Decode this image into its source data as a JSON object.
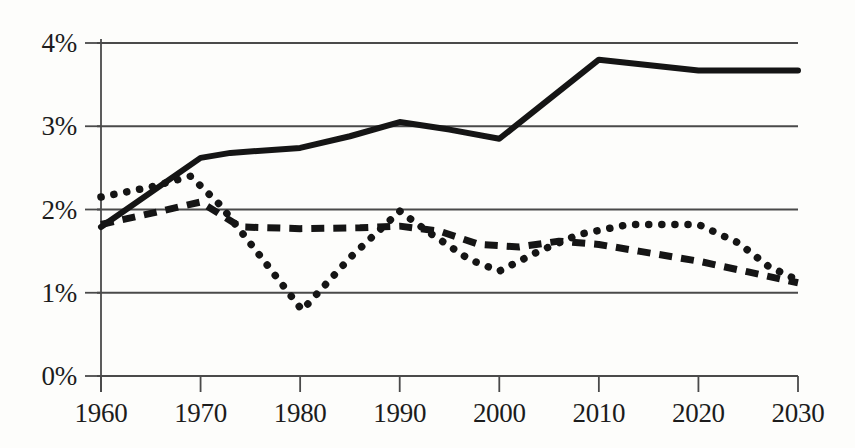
{
  "chart_data": {
    "type": "line",
    "title": "",
    "xlabel": "",
    "ylabel": "",
    "xlim": [
      1960,
      2030
    ],
    "ylim": [
      0,
      4
    ],
    "grid": "horizontal",
    "legend": "none",
    "y_tick_labels": [
      "0%",
      "1%",
      "2%",
      "3%",
      "4%"
    ],
    "y_tick_values": [
      0,
      1,
      2,
      3,
      4
    ],
    "x_tick_labels": [
      "1960",
      "1970",
      "1980",
      "1990",
      "2000",
      "2010",
      "2020",
      "2030"
    ],
    "x_tick_values": [
      1960,
      1970,
      1980,
      1990,
      2000,
      2010,
      2020,
      2030
    ],
    "series": [
      {
        "name": "solid-series",
        "style": "solid",
        "color": "#151515",
        "width": 6,
        "x": [
          1960,
          1970,
          1973,
          1980,
          1985,
          1990,
          1995,
          2000,
          2010,
          2020,
          2030
        ],
        "values": [
          1.79,
          2.62,
          2.68,
          2.74,
          2.88,
          3.05,
          2.96,
          2.85,
          3.8,
          3.67,
          3.67
        ]
      },
      {
        "name": "dotted-series",
        "style": "dotted",
        "color": "#151515",
        "width": 7,
        "x": [
          1960,
          1965,
          1969,
          1972,
          1976,
          1980.2,
          1985,
          1990,
          1993,
          1997,
          2000,
          2004,
          2008,
          2013,
          2020,
          2024,
          2027,
          2030
        ],
        "values": [
          2.15,
          2.27,
          2.4,
          2.05,
          1.44,
          0.79,
          1.42,
          1.98,
          1.72,
          1.4,
          1.26,
          1.5,
          1.7,
          1.82,
          1.82,
          1.6,
          1.32,
          1.15
        ]
      },
      {
        "name": "dashed-series",
        "style": "dashed",
        "color": "#151515",
        "width": 7,
        "x": [
          1960,
          1966,
          1970,
          1974,
          1980,
          1986,
          1990,
          1994,
          1998,
          2002,
          2006,
          2010,
          2014,
          2020,
          2025,
          2030
        ],
        "values": [
          1.82,
          1.98,
          2.09,
          1.79,
          1.77,
          1.78,
          1.8,
          1.74,
          1.58,
          1.55,
          1.62,
          1.58,
          1.5,
          1.38,
          1.25,
          1.12
        ]
      }
    ]
  },
  "axes": {
    "axis_color": "#4a4a4a",
    "tick_color": "#4a4a4a",
    "background": "#fdfdfb"
  }
}
